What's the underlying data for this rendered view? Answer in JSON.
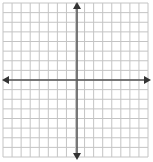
{
  "diagram": {
    "type": "coordinate-plane",
    "grid": {
      "columns": 16,
      "rows": 16,
      "left": 3,
      "top": 3,
      "right": 148,
      "bottom": 157,
      "line_color": "#c4c4c4",
      "background": "#ffffff"
    },
    "axes": {
      "x_axis_y": 80,
      "y_axis_x": 77,
      "color": "#555555",
      "arrowheads": [
        "left",
        "right",
        "up",
        "down"
      ]
    }
  }
}
